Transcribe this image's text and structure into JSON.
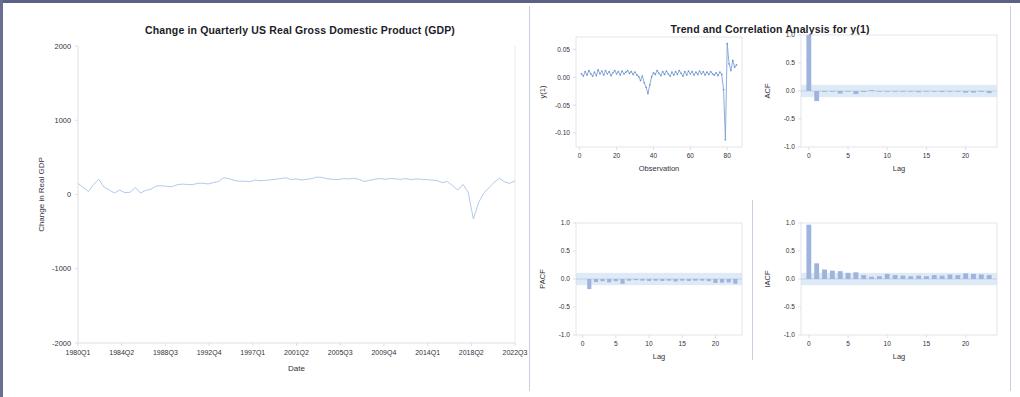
{
  "frame": {
    "border_color": "#5b6085",
    "background": "#ffffff"
  },
  "left_panel": {
    "title": "Change in Quarterly US Real Gross Domestic Product (GDP)",
    "xlabel": "Date",
    "ylabel": "Change in Real GDP"
  },
  "right_panel": {
    "title": "Trend and Correlation Analysis for y(1)"
  },
  "chart_data": [
    {
      "id": "gdp-series",
      "type": "line",
      "title": "Change in Quarterly US Real Gross Domestic Product (GDP)",
      "xlabel": "Date",
      "ylabel": "Change in Real GDP",
      "ylim": [
        -2000,
        2000
      ],
      "yticks": [
        2000,
        1000,
        0,
        -1000,
        -2000
      ],
      "ytick_labels": [
        "2000",
        "1000",
        "0",
        "-1000",
        "-2000"
      ],
      "xtick_labels": [
        "1980Q1",
        "1984Q2",
        "1988Q3",
        "1992Q4",
        "1997Q1",
        "2001Q2",
        "2005Q3",
        "2009Q4",
        "2014Q1",
        "2018Q2",
        "2022Q3"
      ],
      "grid": false,
      "line_color": "#a8c4e8",
      "x": [
        0,
        1,
        2,
        3,
        4,
        5,
        6,
        7,
        8,
        9,
        10,
        11,
        12,
        13,
        14,
        15,
        16,
        17,
        18,
        19,
        20,
        21,
        22,
        23,
        24,
        25,
        26,
        27,
        28,
        29,
        30,
        31,
        32,
        33,
        34,
        35,
        36,
        37,
        38,
        39,
        40,
        41,
        42,
        43,
        44,
        45,
        46,
        47,
        48,
        49,
        50,
        51,
        52,
        53,
        54,
        55,
        56,
        57,
        58,
        59,
        60,
        61,
        62,
        63,
        64,
        65,
        66,
        67,
        68,
        69,
        70,
        71,
        72,
        73,
        74,
        75,
        76,
        77,
        78,
        79,
        80,
        81,
        82,
        83,
        84,
        85
      ],
      "values": [
        150,
        95,
        40,
        135,
        205,
        100,
        60,
        20,
        60,
        25,
        30,
        95,
        20,
        55,
        70,
        115,
        118,
        110,
        105,
        130,
        140,
        135,
        132,
        150,
        152,
        142,
        160,
        175,
        225,
        215,
        190,
        178,
        180,
        172,
        195,
        185,
        190,
        198,
        205,
        215,
        225,
        200,
        210,
        195,
        205,
        215,
        235,
        228,
        210,
        205,
        200,
        215,
        210,
        218,
        205,
        175,
        190,
        205,
        215,
        205,
        215,
        210,
        205,
        215,
        200,
        210,
        205,
        200,
        195,
        188,
        160,
        175,
        120,
        60,
        135,
        30,
        -330,
        -110,
        20,
        90,
        165,
        220,
        170,
        150,
        185
      ]
    },
    {
      "id": "y1-observation",
      "type": "line",
      "xlabel": "Observation",
      "ylabel": "y(1)",
      "ylim": [
        -0.125,
        0.072
      ],
      "yticks": [
        0.05,
        0.0,
        -0.05,
        -0.1
      ],
      "ytick_labels": [
        "0.05",
        "0.00",
        "-0.05",
        "-0.10"
      ],
      "xlim": [
        -2,
        88
      ],
      "xticks": [
        0,
        20,
        40,
        60,
        80
      ],
      "xtick_labels": [
        "0",
        "20",
        "40",
        "60",
        "80"
      ],
      "grid": false,
      "line_color": "#7fa3d8",
      "x": [
        1,
        2,
        3,
        4,
        5,
        6,
        7,
        8,
        9,
        10,
        11,
        12,
        13,
        14,
        15,
        16,
        17,
        18,
        19,
        20,
        21,
        22,
        23,
        24,
        25,
        26,
        27,
        28,
        29,
        30,
        31,
        32,
        33,
        34,
        35,
        36,
        37,
        38,
        39,
        40,
        41,
        42,
        43,
        44,
        45,
        46,
        47,
        48,
        49,
        50,
        51,
        52,
        53,
        54,
        55,
        56,
        57,
        58,
        59,
        60,
        61,
        62,
        63,
        64,
        65,
        66,
        67,
        68,
        69,
        70,
        71,
        72,
        73,
        74,
        75,
        76,
        77,
        78,
        79,
        80,
        81,
        82,
        83,
        84,
        85
      ],
      "values": [
        0.006,
        0.002,
        0.01,
        0.004,
        0.012,
        0.006,
        0.002,
        0.009,
        0.003,
        0.013,
        0.006,
        0.011,
        0.004,
        0.012,
        0.006,
        0.01,
        0.003,
        0.008,
        0.012,
        0.006,
        0.01,
        0.004,
        0.011,
        0.006,
        0.009,
        0.012,
        0.007,
        0.01,
        0.005,
        0.009,
        0.004,
        0.001,
        -0.006,
        0.002,
        -0.01,
        -0.018,
        -0.029,
        -0.014,
        0.001,
        0.008,
        0.005,
        0.012,
        0.007,
        0.003,
        0.01,
        0.005,
        0.011,
        0.006,
        0.002,
        0.009,
        0.004,
        0.01,
        0.005,
        0.012,
        0.007,
        0.002,
        0.01,
        0.004,
        0.011,
        0.006,
        0.01,
        0.004,
        0.009,
        0.005,
        0.011,
        0.006,
        0.01,
        0.004,
        0.009,
        0.005,
        0.01,
        0.006,
        0.004,
        0.008,
        0.003,
        0.009,
        0.005,
        -0.022,
        -0.112,
        0.06,
        0.024,
        0.012,
        0.03,
        0.018,
        0.022
      ]
    },
    {
      "id": "acf",
      "type": "bar",
      "xlabel": "Lag",
      "ylabel": "ACF",
      "ylim": [
        -1.0,
        1.0
      ],
      "yticks": [
        1.0,
        0.5,
        0.0,
        -0.5,
        -1.0
      ],
      "ytick_labels": [
        "1.0",
        "0.5",
        "0.0",
        "-0.5",
        "-1.0"
      ],
      "xlim": [
        -1,
        24
      ],
      "xticks": [
        0,
        5,
        10,
        15,
        20
      ],
      "xtick_labels": [
        "0",
        "5",
        "10",
        "15",
        "20"
      ],
      "grid": false,
      "bar_color": "#9fb4dc",
      "conf_band": 0.11,
      "lags": [
        0,
        1,
        2,
        3,
        4,
        5,
        6,
        7,
        8,
        9,
        10,
        11,
        12,
        13,
        14,
        15,
        16,
        17,
        18,
        19,
        20,
        21,
        22,
        23
      ],
      "values": [
        1.0,
        -0.18,
        -0.015,
        -0.01,
        -0.045,
        -0.012,
        -0.055,
        -0.018,
        0.016,
        -0.012,
        -0.008,
        -0.01,
        -0.014,
        -0.008,
        -0.022,
        -0.01,
        -0.012,
        -0.018,
        -0.01,
        -0.008,
        -0.03,
        -0.028,
        -0.016,
        -0.038
      ]
    },
    {
      "id": "pacf",
      "type": "bar",
      "xlabel": "Lag",
      "ylabel": "PACF",
      "ylim": [
        -1.0,
        1.0
      ],
      "yticks": [
        1.0,
        0.5,
        0.0,
        -0.5,
        -1.0
      ],
      "ytick_labels": [
        "1.0",
        "0.5",
        "0.0",
        "-0.5",
        "-1.0"
      ],
      "xlim": [
        -1,
        24
      ],
      "xticks": [
        0,
        5,
        10,
        15,
        20
      ],
      "xtick_labels": [
        "0",
        "5",
        "10",
        "15",
        "20"
      ],
      "grid": false,
      "bar_color": "#9fb4dc",
      "conf_band": 0.11,
      "lags": [
        1,
        2,
        3,
        4,
        5,
        6,
        7,
        8,
        9,
        10,
        11,
        12,
        13,
        14,
        15,
        16,
        17,
        18,
        19,
        20,
        21,
        22,
        23
      ],
      "values": [
        -0.18,
        -0.055,
        -0.04,
        -0.06,
        -0.04,
        -0.085,
        -0.03,
        -0.02,
        -0.03,
        -0.035,
        -0.03,
        -0.035,
        -0.03,
        -0.045,
        -0.03,
        -0.035,
        -0.03,
        -0.03,
        -0.04,
        -0.07,
        -0.065,
        -0.06,
        -0.085
      ]
    },
    {
      "id": "iacf",
      "type": "bar",
      "xlabel": "Lag",
      "ylabel": "IACF",
      "ylim": [
        -1.0,
        1.0
      ],
      "yticks": [
        1.0,
        0.5,
        0.0,
        -0.5,
        -1.0
      ],
      "ytick_labels": [
        "1.0",
        "0.5",
        "0.0",
        "-0.5",
        "-1.0"
      ],
      "xlim": [
        -1,
        24
      ],
      "xticks": [
        0,
        5,
        10,
        15,
        20
      ],
      "xtick_labels": [
        "0",
        "5",
        "10",
        "15",
        "20"
      ],
      "grid": false,
      "bar_color": "#9fb4dc",
      "conf_band": 0.11,
      "lags": [
        0,
        1,
        2,
        3,
        4,
        5,
        6,
        7,
        8,
        9,
        10,
        11,
        12,
        13,
        14,
        15,
        16,
        17,
        18,
        19,
        20,
        21,
        22,
        23
      ],
      "values": [
        0.97,
        0.28,
        0.17,
        0.15,
        0.14,
        0.11,
        0.12,
        0.07,
        0.04,
        0.05,
        0.09,
        0.07,
        0.06,
        0.05,
        0.06,
        0.05,
        0.07,
        0.06,
        0.08,
        0.07,
        0.1,
        0.09,
        0.08,
        0.07
      ]
    }
  ]
}
